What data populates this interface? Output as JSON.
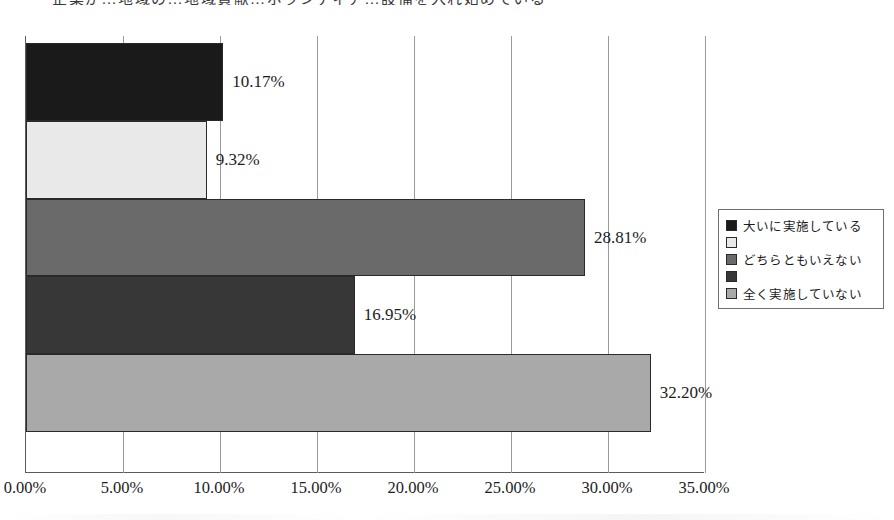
{
  "chart_data": {
    "type": "bar",
    "orientation": "horizontal",
    "title": "企業が…地域の…地域貢献…ボランティア…設備を入れ始めている",
    "xlabel": "",
    "ylabel": "",
    "xlim": [
      0,
      35
    ],
    "xtick_labels": [
      "0.00%",
      "5.00%",
      "10.00%",
      "15.00%",
      "20.00%",
      "25.00%",
      "30.00%",
      "35.00%"
    ],
    "xtick_values": [
      0,
      5,
      10,
      15,
      20,
      25,
      30,
      35
    ],
    "grid": true,
    "legend_position": "right",
    "categories": [
      "大いに実施している",
      "",
      "どちらともいえない",
      "",
      "全く実施していない"
    ],
    "values": [
      10.17,
      9.32,
      28.81,
      16.95,
      32.2
    ],
    "data_labels": [
      "10.17%",
      "9.32%",
      "28.81%",
      "16.95%",
      "32.20%"
    ],
    "colors": [
      "#1a1a1a",
      "#e9e9e9",
      "#6a6a6a",
      "#373737",
      "#a9a9a9"
    ]
  },
  "legend": {
    "items": [
      {
        "label": "大いに実施している",
        "color": "#1a1a1a"
      },
      {
        "label": "",
        "color": "#e9e9e9"
      },
      {
        "label": "どちらともいえない",
        "color": "#6a6a6a"
      },
      {
        "label": "",
        "color": "#373737"
      },
      {
        "label": "全く実施していない",
        "color": "#a9a9a9"
      }
    ]
  }
}
